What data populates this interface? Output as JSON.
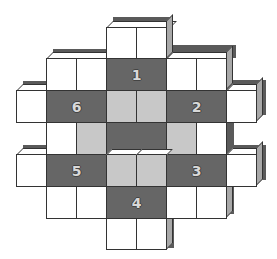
{
  "diagram": {
    "type": "cube-net-puzzle",
    "grid": {
      "origin_x": 16,
      "origin_y": 27,
      "cell_w": 30,
      "cell_h": 32
    },
    "colors": {
      "white": "#ffffff",
      "light": "#c8c8c8",
      "dark": "#666666",
      "shadow": "#5a5a5a",
      "side": "#a8a8a8",
      "outline": "#333333"
    },
    "faces": [
      {
        "id": "face-1",
        "label": "1",
        "row": 1,
        "col": 3,
        "span": 2
      },
      {
        "id": "face-2",
        "label": "2",
        "row": 2,
        "col": 5,
        "span": 2
      },
      {
        "id": "face-3",
        "label": "3",
        "row": 4,
        "col": 5,
        "span": 2
      },
      {
        "id": "face-4",
        "label": "4",
        "row": 5,
        "col": 3,
        "span": 2
      },
      {
        "id": "face-5",
        "label": "5",
        "row": 4,
        "col": 1,
        "span": 2
      },
      {
        "id": "face-6",
        "label": "6",
        "row": 2,
        "col": 1,
        "span": 2
      }
    ]
  }
}
